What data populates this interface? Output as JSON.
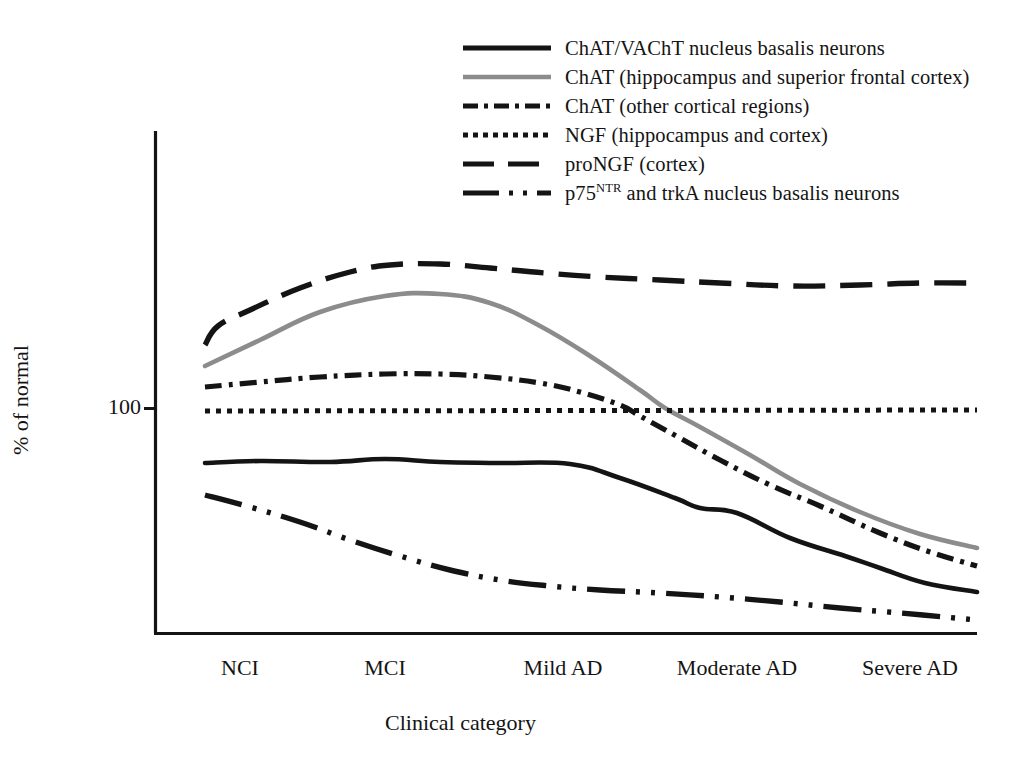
{
  "figure": {
    "name": "cholinergic-markers-across-clinical-categories"
  },
  "axes": {
    "y_label": "% of normal",
    "y_ticks": [
      {
        "value": "100",
        "pixel_y": 408
      }
    ],
    "x_label": "Clinical category",
    "x_categories": [
      "NCI",
      "MCI",
      "Mild AD",
      "Moderate AD",
      "Severe AD"
    ],
    "x_category_pixels": [
      240,
      385,
      563,
      737,
      910
    ],
    "plot_box": {
      "left": 155,
      "right": 977,
      "top": 131,
      "bottom": 633
    }
  },
  "legend": {
    "position": "top-right",
    "entries": [
      {
        "style": "solid",
        "color": "#141414",
        "label": "ChAT/VAChT nucleus basalis neurons"
      },
      {
        "style": "solid",
        "color": "#8c8c8c",
        "label": "ChAT (hippocampus and superior frontal cortex)"
      },
      {
        "style": "dash-dot",
        "color": "#141414",
        "label": "ChAT (other cortical regions)"
      },
      {
        "style": "dotted",
        "color": "#141414",
        "label": "NGF (hippocampus and cortex)"
      },
      {
        "style": "long-dash",
        "color": "#141414",
        "label": "proNGF (cortex)"
      },
      {
        "style": "dash-dot-dot",
        "color": "#141414",
        "label_html": "p75<sup>NTR</sup> and trkA nucleus basalis neurons",
        "label": "p75NTR and trkA nucleus basalis neurons"
      }
    ]
  },
  "chart_data": {
    "type": "line",
    "title": "",
    "xlabel": "Clinical category",
    "ylabel": "% of normal",
    "categories": [
      "NCI",
      "MCI",
      "Mild AD",
      "Moderate AD",
      "Severe AD"
    ],
    "ylim": [
      0,
      190
    ],
    "yticks": [
      100
    ],
    "grid": false,
    "legend_position": "top-right",
    "note": "Schematic curves; y values are approximate percent-of-normal readings inferred from the 100% reference line.",
    "series": [
      {
        "name": "ChAT/VAChT nucleus basalis neurons",
        "style": "solid",
        "color": "#141414",
        "values": [
          78,
          79,
          78,
          55,
          32
        ],
        "points": [
          [
            205,
            463
          ],
          [
            260,
            461
          ],
          [
            330,
            462
          ],
          [
            385,
            459
          ],
          [
            440,
            462
          ],
          [
            500,
            463
          ],
          [
            570,
            464
          ],
          [
            620,
            478
          ],
          [
            675,
            498
          ],
          [
            700,
            508
          ],
          [
            737,
            513
          ],
          [
            790,
            538
          ],
          [
            845,
            556
          ],
          [
            880,
            568
          ],
          [
            925,
            583
          ],
          [
            977,
            592
          ]
        ]
      },
      {
        "name": "ChAT (hippocampus and superior frontal cortex)",
        "style": "solid",
        "color": "#8c8c8c",
        "values": [
          112,
          143,
          133,
          95,
          52
        ],
        "points": [
          [
            205,
            366
          ],
          [
            260,
            340
          ],
          [
            320,
            312
          ],
          [
            385,
            296
          ],
          [
            440,
            294
          ],
          [
            490,
            303
          ],
          [
            540,
            326
          ],
          [
            590,
            356
          ],
          [
            640,
            390
          ],
          [
            665,
            408
          ],
          [
            700,
            427
          ],
          [
            750,
            455
          ],
          [
            800,
            484
          ],
          [
            860,
            512
          ],
          [
            920,
            534
          ],
          [
            977,
            548
          ]
        ]
      },
      {
        "name": "ChAT (other cortical regions)",
        "style": "dash-dot",
        "color": "#141414",
        "values": [
          107,
          113,
          112,
          88,
          48
        ],
        "points": [
          [
            205,
            387
          ],
          [
            260,
            382
          ],
          [
            320,
            377
          ],
          [
            385,
            374
          ],
          [
            440,
            374
          ],
          [
            490,
            377
          ],
          [
            540,
            383
          ],
          [
            580,
            392
          ],
          [
            620,
            405
          ],
          [
            640,
            416
          ],
          [
            680,
            438
          ],
          [
            720,
            460
          ],
          [
            770,
            485
          ],
          [
            820,
            506
          ],
          [
            880,
            533
          ],
          [
            930,
            552
          ],
          [
            977,
            566
          ]
        ]
      },
      {
        "name": "NGF (hippocampus and cortex)",
        "style": "dotted",
        "color": "#141414",
        "values": [
          100,
          100,
          100,
          100,
          100
        ],
        "points": [
          [
            205,
            411
          ],
          [
            977,
            410
          ]
        ]
      },
      {
        "name": "proNGF (cortex)",
        "style": "long-dash",
        "color": "#141414",
        "values": [
          131,
          160,
          157,
          151,
          148
        ],
        "points": [
          [
            205,
            345
          ],
          [
            218,
            326
          ],
          [
            250,
            310
          ],
          [
            300,
            288
          ],
          [
            350,
            272
          ],
          [
            390,
            265
          ],
          [
            440,
            264
          ],
          [
            490,
            268
          ],
          [
            545,
            273
          ],
          [
            600,
            277
          ],
          [
            660,
            280
          ],
          [
            720,
            283
          ],
          [
            790,
            286
          ],
          [
            860,
            285
          ],
          [
            920,
            283
          ],
          [
            977,
            283
          ]
        ]
      },
      {
        "name": "p75NTR and trkA nucleus basalis neurons",
        "style": "dash-dot-dot",
        "color": "#141414",
        "values": [
          72,
          47,
          33,
          27,
          24
        ],
        "points": [
          [
            205,
            495
          ],
          [
            250,
            507
          ],
          [
            300,
            522
          ],
          [
            350,
            540
          ],
          [
            400,
            556
          ],
          [
            450,
            570
          ],
          [
            500,
            580
          ],
          [
            550,
            586
          ],
          [
            600,
            590
          ],
          [
            660,
            593
          ],
          [
            720,
            597
          ],
          [
            780,
            602
          ],
          [
            840,
            608
          ],
          [
            900,
            613
          ],
          [
            977,
            620
          ]
        ]
      }
    ]
  }
}
